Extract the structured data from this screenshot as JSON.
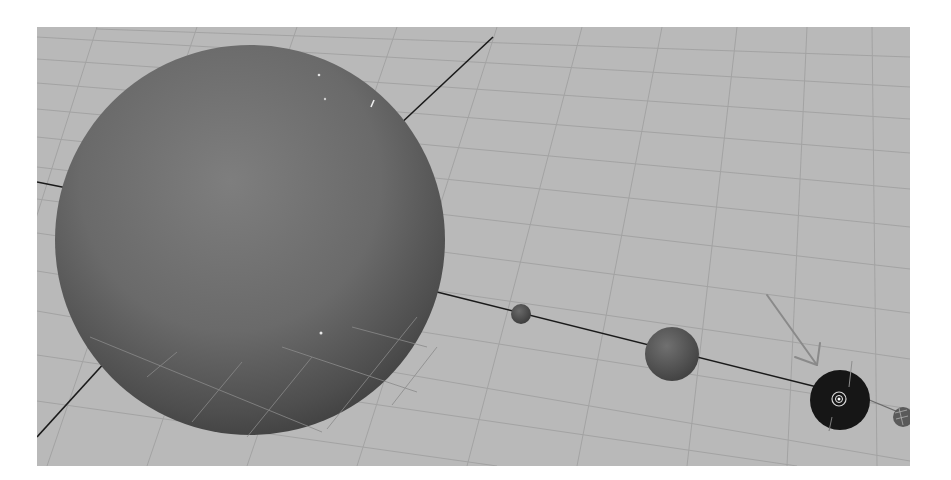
{
  "viewport": {
    "name": "3D perspective viewport",
    "background_color": "#b9b9b9",
    "grid_color": "#a2a2a2",
    "axis_color": "#1a1a1a"
  },
  "scene": {
    "objects": [
      {
        "id": "sun",
        "label": "Sun",
        "type": "sphere",
        "color": "#6d6d6d",
        "selected": false
      },
      {
        "id": "planet-1",
        "label": "Planet 1",
        "type": "sphere",
        "color": "#585858",
        "selected": false
      },
      {
        "id": "planet-2",
        "label": "Planet 2",
        "type": "sphere",
        "color": "#5e5e5e",
        "selected": false
      },
      {
        "id": "planet-3",
        "label": "Planet 3",
        "type": "sphere",
        "color": "#151515",
        "selected": true
      },
      {
        "id": "planet-4",
        "label": "Planet 4",
        "type": "sphere",
        "color": "#4a4a4a",
        "selected": false
      }
    ],
    "annotation": {
      "type": "arrow",
      "points_to": "planet-3",
      "color": "#8a8a8a"
    },
    "manipulator": {
      "target": "planet-3",
      "color": "#e8e8e8"
    }
  }
}
